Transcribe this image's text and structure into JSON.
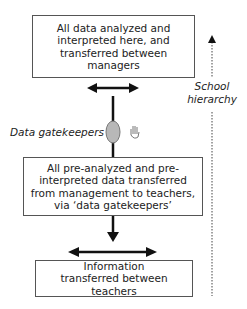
{
  "diagram": {
    "top_box": {
      "text": "All data analyzed and interpreted here, and transferred between managers"
    },
    "middle_box": {
      "text": "All pre-analyzed and pre-interpreted data transferred from management to teachers, via ‘data gatekeepers’"
    },
    "bottom_box": {
      "text": "Information transferred between teachers"
    },
    "gatekeeper_label": "Data gatekeepers",
    "hierarchy_label_line1": "School",
    "hierarchy_label_line2": "hierarchy",
    "colors": {
      "line": "#111111",
      "ellipse_fill": "#b8b8b8",
      "border": "#555555"
    }
  }
}
